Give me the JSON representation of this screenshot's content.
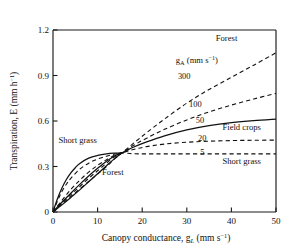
{
  "chart_data": {
    "type": "line",
    "title": "",
    "xlabel": "Canopy conductance, g_L (mm s^-1)",
    "ylabel": "Transpiration, E (mm h^-1)",
    "xlim": [
      0,
      50
    ],
    "ylim": [
      0,
      1.2
    ],
    "xticks": [
      0,
      10,
      20,
      30,
      40,
      50
    ],
    "yticks": [
      0,
      0.3,
      0.6,
      0.9,
      1.2
    ],
    "xtick_labels": [
      "0",
      "10",
      "20",
      "30",
      "40",
      "50"
    ],
    "ytick_labels": [
      "0",
      "0.3",
      "0.6",
      "0.9",
      "1.2"
    ],
    "grid": false,
    "legend_position": "inline-annotations",
    "legend_title": "g_A (mm s^-1)",
    "crossover_point": [
      15.5,
      0.39
    ],
    "series": [
      {
        "name": "300",
        "label": "300",
        "style": "dashed",
        "vegetation": "Forest",
        "x": [
          0,
          2,
          4,
          6,
          8,
          10,
          12,
          14,
          15.5,
          18,
          21,
          25,
          30,
          35,
          40,
          45,
          50
        ],
        "y": [
          0,
          0.052,
          0.103,
          0.152,
          0.201,
          0.25,
          0.3,
          0.355,
          0.39,
          0.452,
          0.523,
          0.613,
          0.718,
          0.808,
          0.888,
          0.968,
          1.05
        ]
      },
      {
        "name": "100",
        "label": "100",
        "style": "dashed",
        "vegetation": "",
        "x": [
          0,
          2,
          4,
          6,
          8,
          10,
          12,
          14,
          15.5,
          18,
          21,
          25,
          30,
          35,
          40,
          45,
          50
        ],
        "y": [
          0,
          0.058,
          0.115,
          0.168,
          0.222,
          0.272,
          0.322,
          0.368,
          0.39,
          0.438,
          0.487,
          0.545,
          0.607,
          0.66,
          0.705,
          0.745,
          0.782
        ]
      },
      {
        "name": "50",
        "label": "50",
        "style": "solid",
        "vegetation": "Field crops",
        "x": [
          0,
          2,
          4,
          6,
          8,
          10,
          12,
          14,
          15.5,
          18,
          21,
          25,
          30,
          35,
          40,
          45,
          50
        ],
        "y": [
          0,
          0.064,
          0.124,
          0.182,
          0.237,
          0.288,
          0.335,
          0.373,
          0.39,
          0.427,
          0.462,
          0.502,
          0.541,
          0.569,
          0.589,
          0.603,
          0.613
        ]
      },
      {
        "name": "20",
        "label": "20",
        "style": "dashed",
        "vegetation": "",
        "x": [
          0,
          2,
          4,
          6,
          8,
          10,
          12,
          14,
          15.5,
          18,
          21,
          25,
          30,
          35,
          40,
          45,
          50
        ],
        "y": [
          0,
          0.077,
          0.148,
          0.21,
          0.263,
          0.308,
          0.345,
          0.376,
          0.39,
          0.412,
          0.431,
          0.448,
          0.46,
          0.467,
          0.471,
          0.473,
          0.474
        ]
      },
      {
        "name": "5",
        "label": "5",
        "style": "dashed",
        "vegetation": "Short grass",
        "x": [
          0,
          1,
          2,
          3,
          4,
          6,
          8,
          10,
          12,
          14,
          15.5,
          18,
          21,
          25,
          30,
          35,
          40,
          45,
          50
        ],
        "y": [
          0,
          0.072,
          0.135,
          0.183,
          0.222,
          0.282,
          0.322,
          0.349,
          0.368,
          0.382,
          0.39,
          0.384,
          0.383,
          0.383,
          0.383,
          0.383,
          0.383,
          0.383,
          0.383
        ]
      },
      {
        "name": "short-grass-upper",
        "label": "Short grass",
        "style": "solid",
        "vegetation": "Short grass",
        "x": [
          0,
          1,
          2,
          3,
          4,
          5,
          6,
          8,
          10,
          12,
          14,
          15.5
        ],
        "y": [
          0,
          0.087,
          0.158,
          0.214,
          0.258,
          0.292,
          0.32,
          0.355,
          0.373,
          0.383,
          0.388,
          0.39
        ]
      },
      {
        "name": "forest-lower",
        "label": "Forest",
        "style": "solid",
        "vegetation": "Forest",
        "x": [
          0,
          2,
          4,
          6,
          8,
          10,
          12,
          14,
          15.5
        ],
        "y": [
          0,
          0.047,
          0.096,
          0.146,
          0.199,
          0.252,
          0.305,
          0.357,
          0.39
        ]
      }
    ],
    "annotations": [
      {
        "id": "forest-top",
        "text": "Forest",
        "x": 36.5,
        "y": 1.125
      },
      {
        "id": "legend-title",
        "text": "g",
        "x": 27.5,
        "y": 0.985
      },
      {
        "id": "val-300",
        "text": "300",
        "x": 28.0,
        "y": 0.878
      },
      {
        "id": "val-100",
        "text": "100",
        "x": 30.5,
        "y": 0.695
      },
      {
        "id": "val-50",
        "text": "50",
        "x": 32.0,
        "y": 0.585
      },
      {
        "id": "val-20",
        "text": "20",
        "x": 32.5,
        "y": 0.47
      },
      {
        "id": "val-5",
        "text": "5",
        "x": 33.0,
        "y": 0.378
      },
      {
        "id": "field-crops",
        "text": "Field crops",
        "x": 38.0,
        "y": 0.54
      },
      {
        "id": "short-grass-r",
        "text": "Short grass",
        "x": 38.0,
        "y": 0.318
      },
      {
        "id": "short-grass-l",
        "text": "Short grass",
        "x": 1.2,
        "y": 0.452
      },
      {
        "id": "forest-left",
        "text": "Forest",
        "x": 11.0,
        "y": 0.243
      }
    ],
    "legend_title_parts": {
      "base": "g",
      "subscript": "A",
      "units": "(mm s",
      "exponent": "−1",
      "close": ")"
    },
    "ylabel_parts": {
      "base": "Transpiration, E (mm h",
      "exponent": "−1",
      "close": ")"
    },
    "xlabel_parts": {
      "base": "Canopy conductance, g",
      "subscript": "L",
      "units": "(mm s",
      "exponent": "−1",
      "close": ")"
    }
  }
}
